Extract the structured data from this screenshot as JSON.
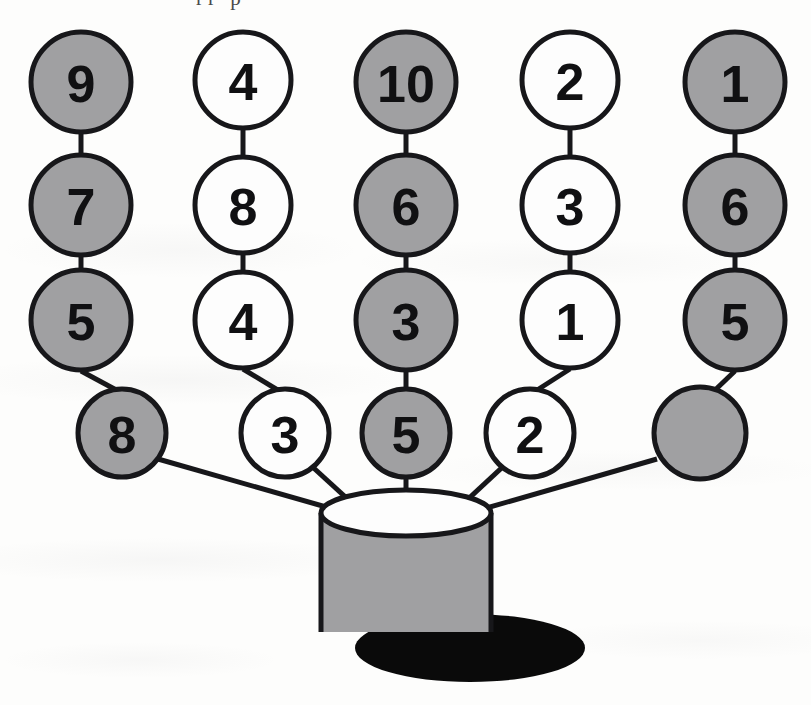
{
  "figure": {
    "top_clipped_text": "rr p",
    "colors": {
      "gray_fill": "#a0a0a2",
      "white_fill": "#fdfdfd",
      "outline": "#17171a",
      "shadow": "#0a0a0a",
      "background": "#fdfdfc"
    },
    "structure": {
      "columns": 5,
      "rows": 4,
      "container": "pot"
    },
    "columns": [
      {
        "index": 1,
        "shade": "gray",
        "values": [
          "9",
          "7",
          "5",
          "8"
        ]
      },
      {
        "index": 2,
        "shade": "white",
        "values": [
          "4",
          "8",
          "4",
          "3"
        ]
      },
      {
        "index": 3,
        "shade": "gray",
        "values": [
          "10",
          "6",
          "3",
          "5"
        ]
      },
      {
        "index": 4,
        "shade": "white",
        "values": [
          "2",
          "3",
          "1",
          "2"
        ]
      },
      {
        "index": 5,
        "shade": "gray",
        "values": [
          "1",
          "6",
          "5",
          ""
        ]
      }
    ],
    "rows": [
      {
        "index": 1,
        "values": [
          "9",
          "4",
          "10",
          "2",
          "1"
        ]
      },
      {
        "index": 2,
        "values": [
          "7",
          "8",
          "6",
          "3",
          "6"
        ]
      },
      {
        "index": 3,
        "values": [
          "5",
          "4",
          "3",
          "1",
          "5"
        ]
      },
      {
        "index": 4,
        "values": [
          "8",
          "3",
          "5",
          "2",
          ""
        ]
      }
    ],
    "nodes": {
      "c1r1": "9",
      "c1r2": "7",
      "c1r3": "5",
      "c1r4": "8",
      "c2r1": "4",
      "c2r2": "8",
      "c2r3": "4",
      "c2r4": "3",
      "c3r1": "10",
      "c3r2": "6",
      "c3r3": "3",
      "c3r4": "5",
      "c4r1": "2",
      "c4r2": "3",
      "c4r3": "1",
      "c4r4": "2",
      "c5r1": "1",
      "c5r2": "6",
      "c5r3": "5",
      "c5r4": ""
    }
  }
}
